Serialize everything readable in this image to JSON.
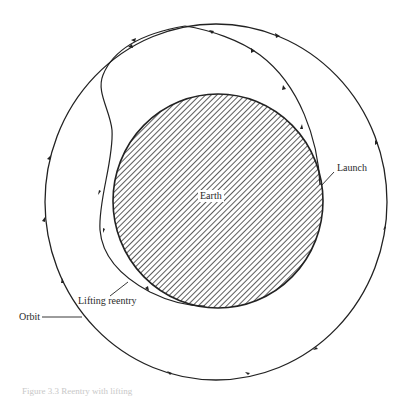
{
  "figure": {
    "caption": "Figure 3.3  Reentry with lifting",
    "labels": {
      "earth": "Earth",
      "launch": "Launch",
      "lifting_reentry": "Lifting reentry",
      "orbit": "Orbit"
    },
    "colors": {
      "line": "#222222",
      "hatch": "#333333",
      "background": "#ffffff"
    },
    "elements": {
      "orbit": {
        "shape": "circle",
        "cx": 216,
        "cy": 202,
        "rx": 171,
        "ry": 178,
        "arrow_direction": "counterclockwise"
      },
      "earth": {
        "shape": "circle",
        "cx": 218,
        "cy": 201,
        "rx": 105,
        "ry": 107,
        "fill": "diagonal-hatch"
      },
      "launch_trajectory": {
        "from": "Earth right side",
        "to": "Orbit top"
      },
      "reentry_trajectory": {
        "from": "Orbit top",
        "to": "Earth lower-left",
        "shape": "S-curve loop"
      }
    }
  }
}
